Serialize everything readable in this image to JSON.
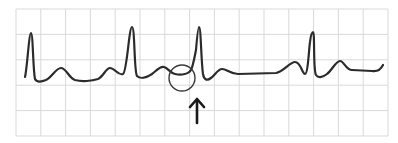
{
  "figure": {
    "type": "ecg-strip",
    "colors": {
      "background": "#ffffff",
      "grid": "#d9d9d9",
      "trace": "#2b2b2b",
      "annotation": "#3a3a3a"
    },
    "grid": {
      "x0": 16,
      "y0": 9,
      "x1": 388,
      "y1": 136,
      "columns": 15,
      "rows": 5
    },
    "trace_path": "M25,77 C27,70 29,33 31,33 C33,33 33,70 35,79 C37,83 41,82 46,80 C52,77 56,68 61,68 C66,68 69,78 75,80 C82,82 92,81 98,79 C103,77 106,68 110,68 C115,68 118,76 123,74 C127,72 129,27 132,27 C135,27 134,72 137,76 C140,79 146,78 152,74 C156,71 160,66 164,67 C168,68 170,73 175,74 C180,75 188,75 191,70 C193,66 194,60 196,50 C197,38 198,27 199,27 C201,27 201,60 203,74 C204,80 207,81 211,78 C215,75 218,69 222,69 C227,69 230,74 238,74 L276,73 C283,72 290,62 295,62 C301,62 302,74 305,74 C308,74 309,48 310,42 C311,34 312,32 313,32 C315,32 313,70 316,75 C318,78 322,78 327,74 C332,70 336,61 340,61 C344,61 346,70 352,70 L372,71 C378,72 381,69 383,65",
    "annotations": {
      "circle": {
        "cx": 182,
        "cy": 78,
        "r": 13
      },
      "arrow": {
        "x": 197,
        "tip_y": 99,
        "tail_y": 123,
        "label": "up-arrow-marker"
      }
    }
  }
}
